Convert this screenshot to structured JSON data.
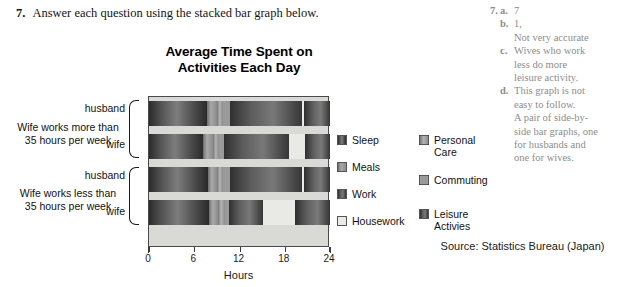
{
  "question": {
    "number": "7.",
    "text": "Answer each question using the stacked bar graph below."
  },
  "chart_data": {
    "type": "bar",
    "orientation": "horizontal",
    "stacked": true,
    "title": "Average Time Spent on Activities Each Day",
    "title_line1": "Average Time Spent on",
    "title_line2": "Activities Each Day",
    "xlabel": "Hours",
    "ylabel": "",
    "xlim": [
      0,
      24
    ],
    "xticks": [
      0,
      6,
      12,
      18,
      24
    ],
    "xticklabels": [
      "0",
      "6",
      "12",
      "18",
      "24"
    ],
    "grid": false,
    "legend_position": "right",
    "categories": [
      "husband",
      "wife",
      "husband",
      "wife"
    ],
    "groups": [
      {
        "label_line1": "Wife works more than",
        "label_line2": "35 hours per week",
        "rows": [
          "husband",
          "wife"
        ]
      },
      {
        "label_line1": "Wife works less than",
        "label_line2": "35 hours per week",
        "rows": [
          "husband",
          "wife"
        ]
      }
    ],
    "series": [
      {
        "name": "Sleep",
        "values": [
          7.7,
          7.2,
          7.8,
          7.9
        ]
      },
      {
        "name": "Meals",
        "values": [
          1.3,
          1.3,
          1.2,
          1.3
        ]
      },
      {
        "name": "Personal Care",
        "values": [
          0.8,
          0.8,
          0.8,
          0.9
        ]
      },
      {
        "name": "Commuting",
        "values": [
          0.9,
          0.6,
          1.0,
          0.5
        ]
      },
      {
        "name": "Work",
        "values": [
          9.6,
          8.6,
          9.5,
          4.5
        ]
      },
      {
        "name": "Housework",
        "values": [
          0.2,
          2.2,
          0.2,
          4.2
        ]
      },
      {
        "name": "Leisure Activies",
        "values": [
          3.5,
          3.3,
          3.5,
          4.7
        ]
      }
    ],
    "bars": [
      {
        "row": "husband",
        "group": 0,
        "segments": [
          {
            "name": "Sleep",
            "start": 0.0,
            "end": 7.7
          },
          {
            "name": "Meals",
            "start": 7.7,
            "end": 9.0
          },
          {
            "name": "Personal Care",
            "start": 9.0,
            "end": 9.8
          },
          {
            "name": "Commuting",
            "start": 9.8,
            "end": 10.7
          },
          {
            "name": "Work",
            "start": 10.7,
            "end": 20.3
          },
          {
            "name": "Housework",
            "start": 20.3,
            "end": 20.5
          },
          {
            "name": "Leisure Activies",
            "start": 20.5,
            "end": 24.0
          }
        ]
      },
      {
        "row": "wife",
        "group": 0,
        "segments": [
          {
            "name": "Sleep",
            "start": 0.0,
            "end": 7.2
          },
          {
            "name": "Meals",
            "start": 7.2,
            "end": 8.5
          },
          {
            "name": "Personal Care",
            "start": 8.5,
            "end": 9.3
          },
          {
            "name": "Commuting",
            "start": 9.3,
            "end": 9.9
          },
          {
            "name": "Work",
            "start": 9.9,
            "end": 18.5
          },
          {
            "name": "Housework",
            "start": 18.5,
            "end": 20.7
          },
          {
            "name": "Leisure Activies",
            "start": 20.7,
            "end": 24.0
          }
        ]
      },
      {
        "row": "husband",
        "group": 1,
        "segments": [
          {
            "name": "Sleep",
            "start": 0.0,
            "end": 7.8
          },
          {
            "name": "Meals",
            "start": 7.8,
            "end": 9.0
          },
          {
            "name": "Personal Care",
            "start": 9.0,
            "end": 9.8
          },
          {
            "name": "Commuting",
            "start": 9.8,
            "end": 10.8
          },
          {
            "name": "Work",
            "start": 10.8,
            "end": 20.3
          },
          {
            "name": "Housework",
            "start": 20.3,
            "end": 20.5
          },
          {
            "name": "Leisure Activies",
            "start": 20.5,
            "end": 24.0
          }
        ]
      },
      {
        "row": "wife",
        "group": 1,
        "segments": [
          {
            "name": "Sleep",
            "start": 0.0,
            "end": 7.9
          },
          {
            "name": "Meals",
            "start": 7.9,
            "end": 9.2
          },
          {
            "name": "Personal Care",
            "start": 9.2,
            "end": 10.1
          },
          {
            "name": "Commuting",
            "start": 10.1,
            "end": 10.6
          },
          {
            "name": "Work",
            "start": 10.6,
            "end": 15.1
          },
          {
            "name": "Housework",
            "start": 15.1,
            "end": 19.3
          },
          {
            "name": "Leisure Activies",
            "start": 19.3,
            "end": 24.0
          }
        ]
      }
    ],
    "legend": [
      {
        "name": "Sleep",
        "label_line1": "Sleep",
        "label_line2": ""
      },
      {
        "name": "Meals",
        "label_line1": "Meals",
        "label_line2": ""
      },
      {
        "name": "Work",
        "label_line1": "Work",
        "label_line2": ""
      },
      {
        "name": "Housework",
        "label_line1": "Housework",
        "label_line2": ""
      },
      {
        "name": "Personal Care",
        "label_line1": "Personal",
        "label_line2": "Care"
      },
      {
        "name": "Commuting",
        "label_line1": "Commuting",
        "label_line2": ""
      },
      {
        "name": "Leisure Activies",
        "label_line1": "Leisure",
        "label_line2": "Activies"
      }
    ],
    "source": "Source: Statistics Bureau (Japan)"
  },
  "answers": {
    "number": "7.",
    "items": [
      {
        "letter": "a.",
        "lines": [
          "7"
        ]
      },
      {
        "letter": "b.",
        "lines": [
          "1,",
          "Not very accurate"
        ]
      },
      {
        "letter": "c.",
        "lines": [
          "Wives who work",
          "less do more",
          "leisure activity."
        ]
      },
      {
        "letter": "d.",
        "lines": [
          "This graph is not",
          "easy to follow.",
          "A pair of side-by-",
          "side bar graphs, one",
          "for husbands and",
          "one for wives."
        ]
      }
    ]
  }
}
